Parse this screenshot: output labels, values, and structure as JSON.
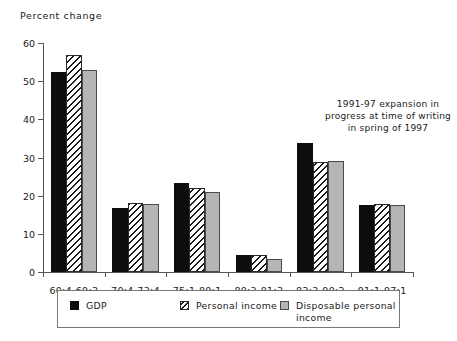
{
  "chart_data": {
    "type": "bar",
    "title": "",
    "subtitle": "",
    "ylabel": "Percent change",
    "xlabel": "",
    "ylim": [
      0,
      60
    ],
    "yticks": [
      0,
      10,
      20,
      30,
      40,
      50,
      60
    ],
    "grid": false,
    "legend_position": "bottom",
    "categories": [
      "60:4-69:3",
      "70:4-73:4",
      "75:1-80:1",
      "80:3-81:3",
      "82:3-90:2",
      "91:1-97:1"
    ],
    "series": [
      {
        "name": "GDP",
        "pattern": "solid-black",
        "color": "#0d0d0d",
        "values": [
          52.4,
          16.7,
          23.4,
          4.4,
          33.9,
          17.6
        ]
      },
      {
        "name": "Personal income",
        "pattern": "diagonal-hatch",
        "color": "#ffffff",
        "values": [
          56.8,
          18.0,
          22.0,
          4.4,
          28.8,
          17.8
        ]
      },
      {
        "name": "Disposable personal income",
        "pattern": "light-gray",
        "color": "#b5b5b5",
        "values": [
          53.0,
          17.8,
          21.0,
          3.5,
          29.0,
          17.6
        ]
      }
    ],
    "annotations": [
      {
        "text": "1991-97 expansion in progress at time of writing in spring of 1997",
        "position": "upper-right"
      }
    ]
  },
  "legend": {
    "items": [
      {
        "label": "GDP"
      },
      {
        "label": "Personal  income"
      },
      {
        "label": "Disposable  personal\nincome"
      }
    ]
  }
}
